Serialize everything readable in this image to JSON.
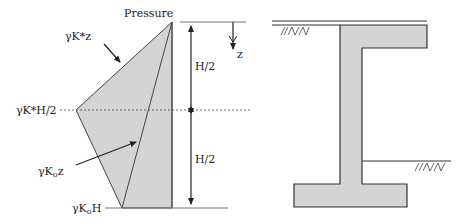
{
  "left_figure": {
    "title": "Pressure",
    "labels": {
      "gkz": "γK*z",
      "gkH2": "γK*H/2",
      "gk0z_main": "γK",
      "gk0z_sub": "o",
      "gk0z_tail": "z",
      "gk0H_main": "γK",
      "gk0H_sub": "o",
      "gk0H_tail": "H",
      "half_top": "H/2",
      "half_bottom": "H/2",
      "z_axis": "z"
    }
  },
  "right_figure": {
    "description": "Cantilever retaining wall with top slab and footing"
  },
  "colors": {
    "fill": "#d4d4d4",
    "stroke": "#333333",
    "dotted": "#666666"
  }
}
